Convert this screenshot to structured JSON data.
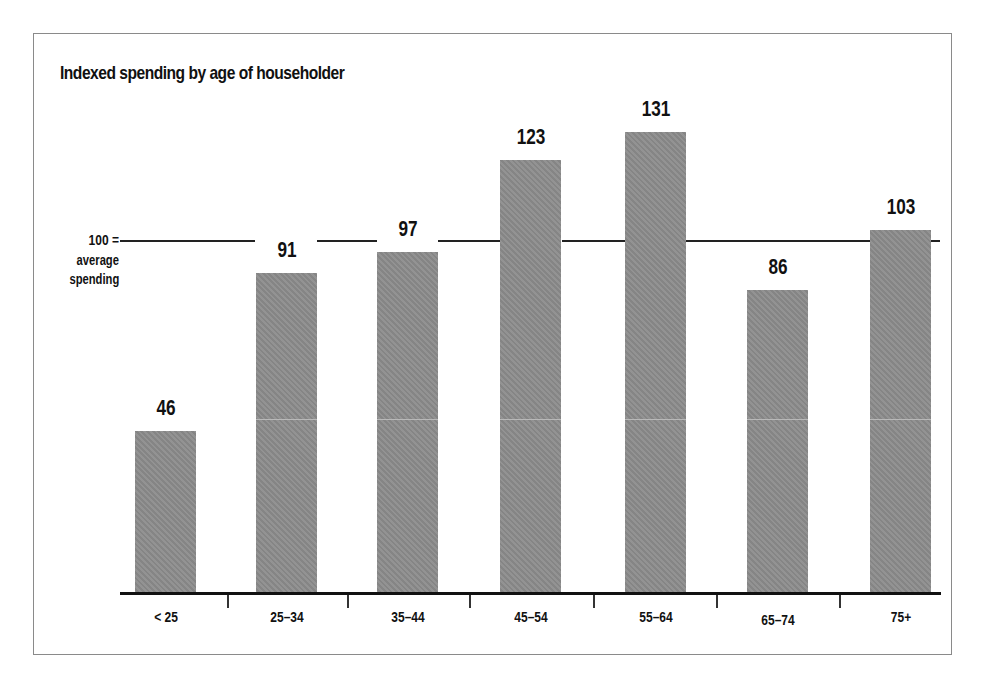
{
  "chart_data": {
    "type": "bar",
    "title": "Indexed spending by age of householder",
    "xlabel": "",
    "ylabel": "",
    "categories": [
      "< 25",
      "25–34",
      "35–44",
      "45–54",
      "55–64",
      "65–74",
      "75+"
    ],
    "values": [
      46,
      91,
      97,
      123,
      131,
      86,
      103
    ],
    "reference_line": {
      "value": 100,
      "label_line1": "100 =",
      "label_line2": "average",
      "label_line3": "spending"
    },
    "ylim": [
      0,
      140
    ],
    "grid": false,
    "legend": null,
    "bar_color": "#8c8c8c"
  }
}
